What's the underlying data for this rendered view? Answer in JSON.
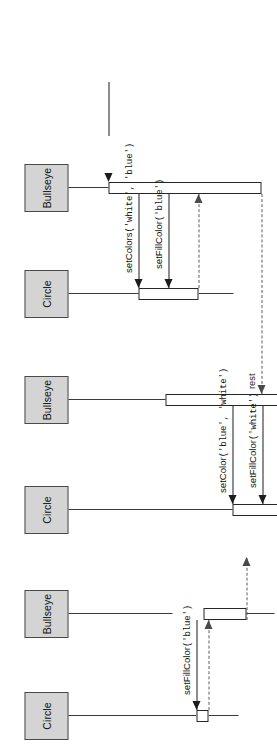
{
  "diagram": {
    "kind": "uml-sequence-diagram",
    "title": "",
    "orientation": "rotated-90-ccw",
    "colors": {
      "participant_fill": "#d4d4d4",
      "participant_border": "#4a4a4a",
      "activation_fill": "#ffffff",
      "activation_border": "#262626",
      "line": "#1c1c1c",
      "return_line": "#5c5c5c",
      "background": "#ffffff"
    },
    "participants": [
      {
        "id": "p0",
        "label": "Circle"
      },
      {
        "id": "p1",
        "label": "Bullseye"
      },
      {
        "id": "p2",
        "label": "Circle"
      },
      {
        "id": "p3",
        "label": "Bullseye"
      },
      {
        "id": "p4",
        "label": "Circle"
      },
      {
        "id": "p5",
        "label": "Bullseye"
      }
    ],
    "messages": [
      {
        "id": "m0",
        "kind": "found",
        "label": "",
        "from": "",
        "to": "p5"
      },
      {
        "id": "m1",
        "kind": "call",
        "name": "setColors",
        "args": "('white', 'blue')",
        "label": "setColors('white', 'blue')",
        "from": "p5",
        "to": "p4"
      },
      {
        "id": "m2",
        "kind": "call",
        "name": "setFillColor",
        "args": "('blue')",
        "label": "setFillColor('blue')",
        "from": "p5",
        "to": "p4"
      },
      {
        "id": "m3",
        "kind": "return",
        "label": "",
        "from": "p4",
        "to": "p5"
      },
      {
        "id": "m4",
        "kind": "return",
        "label": "rest",
        "from": "p5",
        "to": "p3"
      },
      {
        "id": "m5",
        "kind": "call",
        "name": "setColor",
        "args": "('blue', 'white')",
        "label": "setColor('blue', 'white')",
        "from": "p3",
        "to": "p2"
      },
      {
        "id": "m6",
        "kind": "call",
        "name": "setFillColor",
        "args": "('white')",
        "label": "setFillColor('white')",
        "from": "p3",
        "to": "p2"
      },
      {
        "id": "m7",
        "kind": "return",
        "label": "",
        "from": "p2",
        "to": "p3"
      },
      {
        "id": "m8",
        "kind": "return",
        "label": "rest",
        "from": "p3",
        "to": "p1"
      },
      {
        "id": "m9",
        "kind": "call",
        "name": "setFillColor",
        "args": "('blue')",
        "label": "setFillColor('blue')",
        "from": "p1",
        "to": "p0"
      },
      {
        "id": "m10",
        "kind": "return",
        "label": "",
        "from": "p0",
        "to": "p1"
      },
      {
        "id": "m11",
        "kind": "return",
        "label": "",
        "from": "p1",
        "to": "exit"
      }
    ],
    "labels": {
      "rest": "rest",
      "setColors_white_blue": "setColors('white', 'blue')",
      "setFillColor_blue": "setFillColor('blue')",
      "setColor_blue_white": "setColor('blue', 'white')",
      "setFillColor_white": "setFillColor('white')",
      "setFillColor_blue_2": "setFillColor('blue')",
      "circle": "Circle",
      "bullseye": "Bullseye"
    },
    "label_parts": {
      "setColors_white_blue": {
        "name": "setColors",
        "args": "('white', 'blue')"
      },
      "setFillColor_blue": {
        "name": "setFillColor",
        "args": "('blue')"
      },
      "setColor_blue_white": {
        "name": "setColor",
        "args": "('blue', 'white')"
      },
      "setFillColor_white": {
        "name": "setFillColor",
        "args": "('white')"
      },
      "setFillColor_blue_2": {
        "name": "setFillColor",
        "args": "('blue')"
      }
    }
  }
}
